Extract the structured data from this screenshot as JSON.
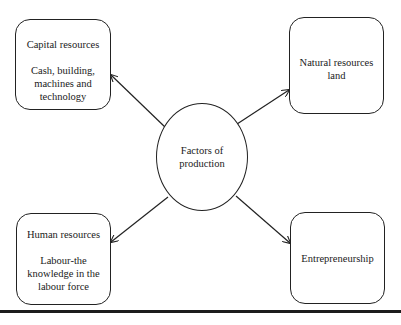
{
  "diagram": {
    "center": {
      "label": "Factors of production"
    },
    "nodes": [
      {
        "id": "capital",
        "title": "Capital resources",
        "description": "Cash, building, machines and technology"
      },
      {
        "id": "natural",
        "title": "Natural resources land",
        "description": ""
      },
      {
        "id": "human",
        "title": "Human resources",
        "description": "Labour-the knowledge in the labour force"
      },
      {
        "id": "entrepreneurship",
        "title": "Entrepreneurship",
        "description": ""
      }
    ],
    "edges": [
      {
        "from": "center",
        "to": "capital",
        "arrow": "to"
      },
      {
        "from": "center",
        "to": "natural",
        "arrow": "to"
      },
      {
        "from": "center",
        "to": "human",
        "arrow": "to"
      },
      {
        "from": "center",
        "to": "entrepreneurship",
        "arrow": "to"
      }
    ],
    "colors": {
      "stroke": "#222222",
      "background": "#ffffff",
      "text": "#1a1a1a"
    }
  }
}
